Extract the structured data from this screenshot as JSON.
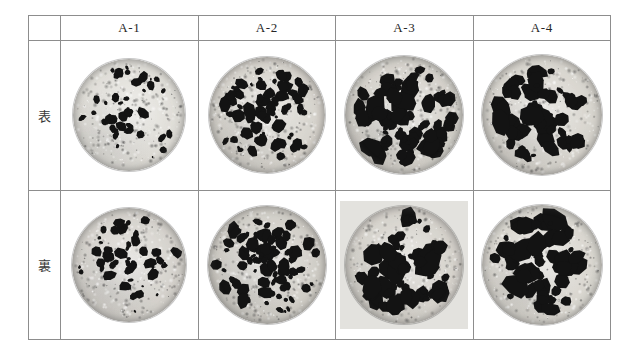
{
  "figure": {
    "kind": "photo-comparison-table",
    "caption_present": false,
    "row_label_column_header": "",
    "columns": [
      {
        "id": "A-1",
        "label": "A-1"
      },
      {
        "id": "A-2",
        "label": "A-2"
      },
      {
        "id": "A-3",
        "label": "A-3"
      },
      {
        "id": "A-4",
        "label": "A-4"
      }
    ],
    "rows": [
      {
        "id": "omote",
        "label": "表"
      },
      {
        "id": "ura",
        "label": "裏"
      }
    ]
  },
  "colors": {
    "grid_line": "#8d8d8d",
    "aggregate_dark": "#131313",
    "matrix_light": "#d9d7d2",
    "matrix_mid": "#b9b7b1",
    "plate_background": "#e3e2de",
    "page_background": "#ffffff",
    "text": "#262626"
  },
  "specimens": [
    {
      "row": "表",
      "column": "A-1",
      "disc_diameter_px": 112,
      "plate_background": false,
      "matrix_tone": "#dedcd6",
      "aggregate_count": 46,
      "aggregate_size_range_px": [
        3,
        12
      ],
      "aggregate_coverage_pct": 14,
      "description": "light speckled matrix with small sparse dark aggregate"
    },
    {
      "row": "表",
      "column": "A-2",
      "disc_diameter_px": 116,
      "plate_background": false,
      "matrix_tone": "#d5d2cb",
      "aggregate_count": 74,
      "aggregate_size_range_px": [
        4,
        16
      ],
      "aggregate_coverage_pct": 30,
      "description": "numerous medium dark aggregate particles"
    },
    {
      "row": "表",
      "column": "A-3",
      "disc_diameter_px": 118,
      "plate_background": false,
      "matrix_tone": "#d2cfc8",
      "aggregate_count": 78,
      "aggregate_size_range_px": [
        5,
        22
      ],
      "aggregate_coverage_pct": 44,
      "description": "dense large angular dark aggregate"
    },
    {
      "row": "表",
      "column": "A-4",
      "disc_diameter_px": 120,
      "plate_background": false,
      "matrix_tone": "#d6d3cc",
      "aggregate_count": 64,
      "aggregate_size_range_px": [
        6,
        26
      ],
      "aggregate_coverage_pct": 46,
      "description": "coarsest blocky dark aggregate"
    },
    {
      "row": "裏",
      "column": "A-1",
      "disc_diameter_px": 114,
      "plate_background": false,
      "matrix_tone": "#d3d0ca",
      "aggregate_count": 52,
      "aggregate_size_range_px": [
        3,
        13
      ],
      "aggregate_coverage_pct": 18,
      "description": "light matrix, small elongated dark particles, grey shading left of centre"
    },
    {
      "row": "裏",
      "column": "A-2",
      "disc_diameter_px": 118,
      "plate_background": false,
      "matrix_tone": "#cfccc5",
      "aggregate_count": 86,
      "aggregate_size_range_px": [
        4,
        15
      ],
      "aggregate_coverage_pct": 36,
      "description": "very numerous small-to-medium dark particles"
    },
    {
      "row": "裏",
      "column": "A-3",
      "disc_diameter_px": 118,
      "plate_background": true,
      "matrix_tone": "#d4d1ca",
      "aggregate_count": 70,
      "aggregate_size_range_px": [
        5,
        22
      ],
      "aggregate_coverage_pct": 42,
      "description": "dense large dark aggregate on light grey plate backdrop"
    },
    {
      "row": "裏",
      "column": "A-4",
      "disc_diameter_px": 120,
      "plate_background": false,
      "matrix_tone": "#d8d5ce",
      "aggregate_count": 62,
      "aggregate_size_range_px": [
        5,
        24
      ],
      "aggregate_coverage_pct": 40,
      "description": "coarse blocky dark aggregate, lighter matrix"
    }
  ]
}
